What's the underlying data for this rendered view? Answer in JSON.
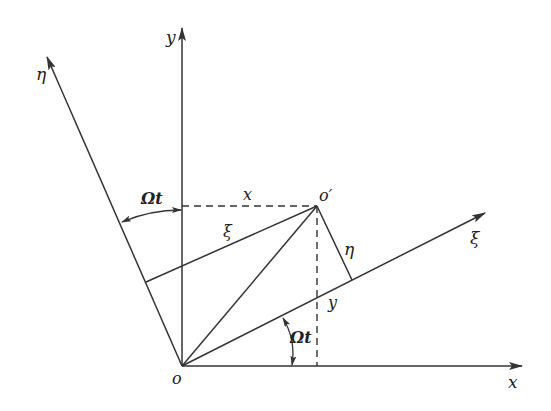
{
  "diagram": {
    "origin_label": "o",
    "moving_point_label": "o′",
    "axes": {
      "x": "x",
      "y": "y",
      "xi": "ξ",
      "eta": "η"
    },
    "segment_labels": {
      "x_projection": "x",
      "y_projection": "y",
      "xi_component": "ξ",
      "eta_component": "η"
    },
    "angle_labels": {
      "upper": "Ωt",
      "lower": "Ωt"
    },
    "colors": {
      "line": "#333333",
      "text": "#222222",
      "background": "#ffffff"
    }
  }
}
